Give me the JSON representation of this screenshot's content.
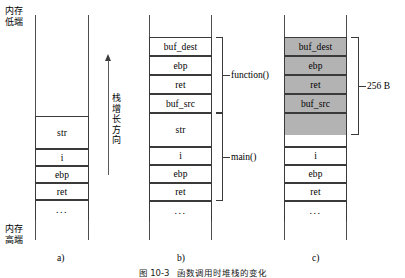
{
  "figure": {
    "caption_number": "图 10-3",
    "caption_text": "函数调用时堆栈的变化"
  },
  "memory_labels": {
    "low": {
      "line1": "内存",
      "line2": "低端"
    },
    "high": {
      "line1": "内存",
      "line2": "高端"
    }
  },
  "stack_growth": {
    "arrow": "up-arrow",
    "chars": [
      "栈",
      "增",
      "长",
      "方",
      "向"
    ]
  },
  "colors": {
    "shaded_fill": "#b3b3b3",
    "cell_border": "#3a3a3a",
    "rail": "#4d4d4d",
    "background": "#ffffff"
  },
  "panels": [
    {
      "id": "a",
      "letter": "a)",
      "cells": [
        {
          "label": "str",
          "shaded": false
        },
        {
          "label": "i",
          "shaded": false
        },
        {
          "label": "ebp",
          "shaded": false
        },
        {
          "label": "ret",
          "shaded": false
        },
        {
          "label": "...",
          "shaded": false
        }
      ],
      "braces": []
    },
    {
      "id": "b",
      "letter": "b)",
      "cells": [
        {
          "label": "buf_dest",
          "shaded": false
        },
        {
          "label": "ebp",
          "shaded": false
        },
        {
          "label": "ret",
          "shaded": false
        },
        {
          "label": "buf_src",
          "shaded": false
        },
        {
          "label": "str",
          "shaded": false
        },
        {
          "label": "i",
          "shaded": false
        },
        {
          "label": "ebp",
          "shaded": false
        },
        {
          "label": "ret",
          "shaded": false
        },
        {
          "label": "...",
          "shaded": false
        }
      ],
      "braces": [
        {
          "label": "function()"
        },
        {
          "label": "main()"
        }
      ]
    },
    {
      "id": "c",
      "letter": "c)",
      "cells": [
        {
          "label": "buf_dest",
          "shaded": true
        },
        {
          "label": "ebp",
          "shaded": true
        },
        {
          "label": "ret",
          "shaded": true
        },
        {
          "label": "buf_src",
          "shaded": true
        },
        {
          "label": "str",
          "shaded": false
        },
        {
          "label": "i",
          "shaded": false
        },
        {
          "label": "ebp",
          "shaded": false
        },
        {
          "label": "ret",
          "shaded": false
        },
        {
          "label": "...",
          "shaded": false
        }
      ],
      "braces": [
        {
          "label": "256 B"
        }
      ]
    }
  ]
}
